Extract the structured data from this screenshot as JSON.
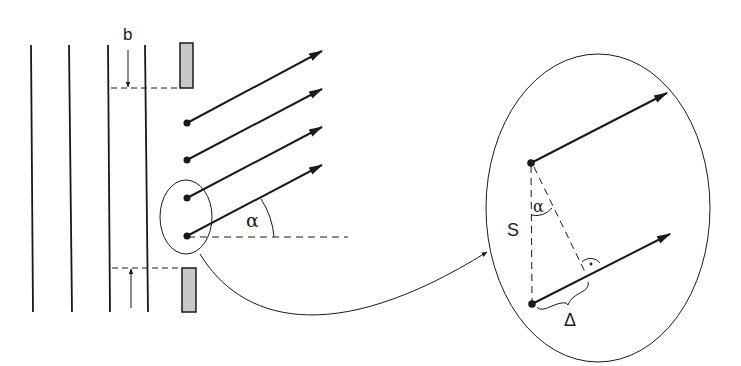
{
  "diagram": {
    "labels": {
      "slit_width": "b",
      "angle": "α",
      "separation": "S",
      "angle_detail": "α",
      "path_difference": "Δ",
      "right_angle_mark": "·"
    },
    "elements": {
      "wavefronts_count": 4,
      "secondary_sources_count": 4,
      "rays_count": 4,
      "detail_rays_count": 2
    },
    "colors": {
      "line": "#1a1a1a",
      "slit_fill": "#c8c8c8",
      "background": "#ffffff"
    }
  }
}
